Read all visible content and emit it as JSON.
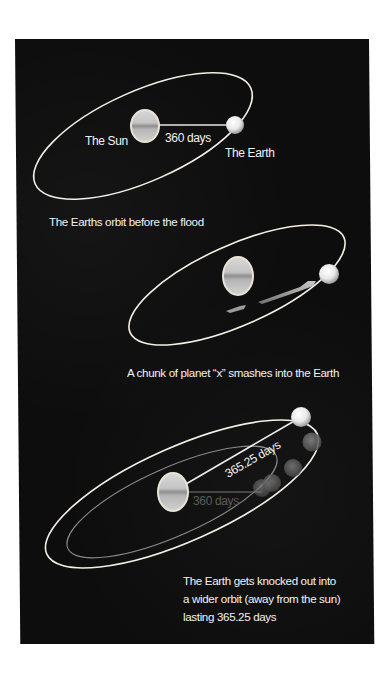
{
  "colors": {
    "background": "#0d0d0d",
    "orbit_stroke": "#f5f0e6",
    "orbit_faint_stroke": "#8a8a8a",
    "text": "#f2f2f2",
    "text_faint": "#5d5d5d",
    "sun_fill": "#b9b9b9",
    "earth_fill": "#efefef"
  },
  "panels": [
    {
      "id": "before-flood",
      "labels": {
        "sun": "The Sun",
        "earth": "The Earth",
        "period": "360 days"
      },
      "caption": "The Earths orbit before the flood"
    },
    {
      "id": "impact",
      "caption": "A chunk of planet “x” smashes into the Earth"
    },
    {
      "id": "after-impact",
      "labels": {
        "new_period": "365.25 days",
        "old_period": "360 days"
      },
      "caption_lines": [
        "The Earth gets knocked out into",
        "a wider orbit (away from the sun)",
        "lasting 365.25 days"
      ]
    }
  ]
}
